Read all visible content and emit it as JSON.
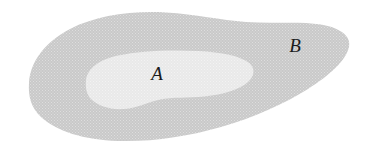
{
  "figure": {
    "kind": "venn-diagram",
    "background_color": "#ffffff",
    "width": 374,
    "height": 159
  },
  "regions": {
    "outer": {
      "label": "B",
      "name": "set-b-region",
      "fill_color": "#cdcdcd",
      "texture": "halftone-dot-screen",
      "label_x": 295,
      "label_y": 52
    },
    "inner": {
      "label": "A",
      "name": "set-a-region",
      "fill_color": "#e9e9e9",
      "texture": "fine-halftone",
      "label_x": 157,
      "label_y": 80
    }
  },
  "paths": {
    "outer_blob": "M 29.0 83.0 C 30.0 62.0 45.0 42.0 70.0 29.0 C 96.0 15.5 132.0 10.5 166.0 12.5 C 196.0 14.2 220.0 20.0 246.0 22.0 C 272.0 24.0 300.0 21.0 321.0 24.5 C 340.0 27.8 351.5 36.0 349.0 47.0 C 346.0 60.5 330.0 75.0 308.0 89.0 C 284.0 104.0 254.0 117.5 221.0 127.0 C 188.0 136.5 152.0 142.0 118.0 141.0 C 84.0 140.0 56.0 131.0 41.0 117.0 C 30.5 107.2 28.2 95.5 29.0 83.0 Z",
    "inner_blob": "M 86.0 80.0 C 87.5 68.0 100.0 59.5 118.0 55.5 C 140.0 50.6 170.0 49.5 198.0 51.0 C 222.0 52.3 240.0 56.0 248.5 62.5 C 255.5 67.9 255.0 75.5 248.0 82.0 C 240.0 89.4 224.0 94.5 204.0 96.5 C 188.0 98.1 172.0 97.0 160.0 99.5 C 147.0 102.2 138.0 108.0 124.0 109.0 C 110.5 110.0 98.0 106.0 91.0 99.0 C 86.5 94.5 85.2 87.0 86.0 80.0 Z"
  }
}
